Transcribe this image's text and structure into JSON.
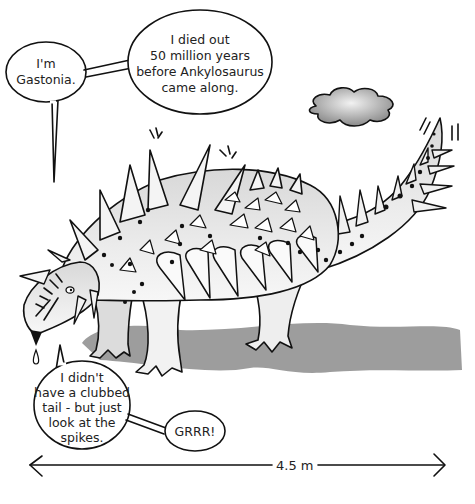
{
  "illustration": {
    "subject": "Gastonia dinosaur",
    "bubbles": {
      "name": [
        "I'm",
        "Gastonia."
      ],
      "fact": [
        "I died out",
        "50 million years",
        "before Ankylosaurus",
        "came along."
      ],
      "tail": [
        "I didn't",
        "have a clubbed",
        "tail - but just",
        "look at the",
        "spikes."
      ],
      "growl": [
        "GRRR!"
      ]
    },
    "measurement": {
      "label": "4.5 m"
    },
    "colors": {
      "ink": "#111111",
      "body": "#e4e4e4",
      "shadow": "#8c8c8c",
      "cloud": "#9a9a9a"
    }
  }
}
